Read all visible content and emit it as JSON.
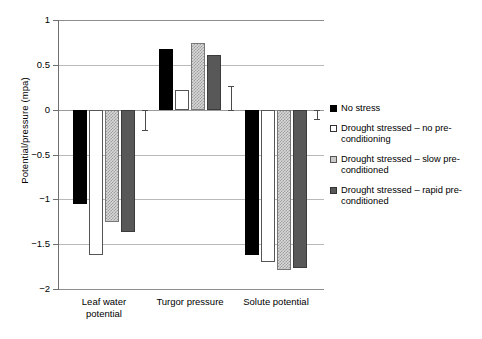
{
  "chart_data": {
    "type": "bar",
    "title": "",
    "xlabel": "",
    "ylabel": "Potential/pressure (mpa)",
    "ylim": [
      -2,
      1
    ],
    "yticks": [
      1,
      0.5,
      0,
      -0.5,
      -1,
      -1.5,
      -2
    ],
    "ytick_labels": [
      "1",
      "0.5",
      "0",
      "−0.5",
      "−1",
      "−1.5",
      "−2"
    ],
    "grid": true,
    "legend_position": "right",
    "categories": [
      "Leaf water potential",
      "Turgor pressure",
      "Solute potential"
    ],
    "series": [
      {
        "name": "No stress",
        "swatch": "black",
        "color": "#000000",
        "values": [
          -1.05,
          0.68,
          -1.62
        ]
      },
      {
        "name": "Drought stressed – no pre-conditioning",
        "swatch": "white",
        "color": "#ffffff",
        "values": [
          -1.62,
          0.22,
          -1.7
        ]
      },
      {
        "name": "Drought stressed – slow pre-conditioned",
        "swatch": "hatched",
        "color": "#d9d9d9",
        "values": [
          -1.25,
          0.74,
          -1.79
        ]
      },
      {
        "name": "Drought stressed – rapid pre-conditioned",
        "swatch": "gray",
        "color": "#585858",
        "values": [
          -1.37,
          0.61,
          -1.77
        ]
      }
    ],
    "error_bars": [
      {
        "category": "Leaf water potential",
        "from": 0,
        "to": -0.23
      },
      {
        "category": "Turgor pressure",
        "from": 0.26,
        "to": 0
      },
      {
        "category": "Solute potential",
        "from": 0,
        "to": -0.1
      }
    ]
  },
  "legend": {
    "items": [
      {
        "label": "No stress"
      },
      {
        "label": "Drought stressed – no pre-conditioning"
      },
      {
        "label": "Drought stressed – slow pre-conditioned"
      },
      {
        "label": "Drought stressed – rapid pre-conditioned"
      }
    ]
  },
  "axis": {
    "y_title": "Potential/pressure (mpa)"
  },
  "categories_display": [
    {
      "line1": "Leaf water",
      "line2": "potential"
    },
    {
      "line1": "Turgor pressure",
      "line2": ""
    },
    {
      "line1": "Solute potential",
      "line2": ""
    }
  ]
}
